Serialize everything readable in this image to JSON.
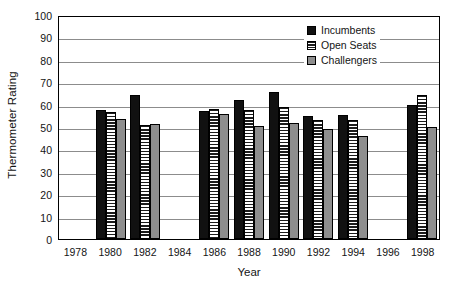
{
  "chart_data": {
    "type": "bar",
    "title": "",
    "xlabel": "Year",
    "ylabel": "Thermometer Rating",
    "ylim": [
      0,
      100
    ],
    "ytick_step": 10,
    "yticks": [
      100,
      90,
      80,
      70,
      60,
      50,
      40,
      30,
      20,
      10,
      0
    ],
    "grid": true,
    "legend_position": "top-right",
    "categories": [
      1978,
      1980,
      1982,
      1984,
      1986,
      1988,
      1990,
      1992,
      1994,
      1996,
      1998
    ],
    "series": [
      {
        "name": "Incumbents",
        "color": "#111111",
        "pattern": "solid-black",
        "values": [
          null,
          57.5,
          64.5,
          null,
          57,
          62,
          65.5,
          55,
          55.5,
          null,
          60
        ]
      },
      {
        "name": "Open Seats",
        "color": "#1c1c1c",
        "pattern": "horizontal-stripes",
        "values": [
          null,
          56.5,
          51,
          null,
          58,
          57.5,
          59,
          53,
          53,
          null,
          64.5
        ]
      },
      {
        "name": "Challengers",
        "color": "#8e8e8e",
        "pattern": "solid-gray",
        "values": [
          null,
          53.5,
          51.5,
          null,
          56,
          50.5,
          52,
          49,
          46,
          null,
          50
        ]
      }
    ],
    "empty_categories": [
      1978,
      1984,
      1996
    ]
  },
  "axes": {
    "y_title": "Thermometer Rating",
    "x_title": "Year",
    "y_tick_labels": [
      "100",
      "90",
      "80",
      "70",
      "60",
      "50",
      "40",
      "30",
      "20",
      "10",
      "0"
    ],
    "x_tick_labels": [
      "1978",
      "1980",
      "1982",
      "1984",
      "1986",
      "1988",
      "1990",
      "1992",
      "1994",
      "1996",
      "1998"
    ]
  },
  "legend": {
    "items": [
      {
        "label": "Incumbents",
        "swatch": "solid-black-swatch"
      },
      {
        "label": "Open Seats",
        "swatch": "striped-swatch"
      },
      {
        "label": "Challengers",
        "swatch": "solid-gray-swatch"
      }
    ]
  }
}
